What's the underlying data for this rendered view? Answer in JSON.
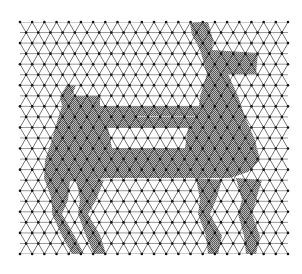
{
  "figure": {
    "width": 302,
    "height": 274,
    "background": "#ffffff",
    "lattice": {
      "x0": 20,
      "x1": 288,
      "y0": 22,
      "y1": 254,
      "rows": 22,
      "cols": 22,
      "line_color": "#3a3a3a",
      "horizontal_color": "#8a8a8a",
      "dot_color": "#111111",
      "dot_radius": 1.3
    },
    "fill": {
      "pattern_dark": "#555555",
      "pattern_light": "#bdbdbd"
    },
    "silhouette": {
      "parts": [
        {
          "name": "tail",
          "points": [
            [
              60,
              96
            ],
            [
              67,
              85
            ],
            [
              76,
              85
            ],
            [
              72,
              96
            ],
            [
              62,
              106
            ]
          ]
        },
        {
          "name": "body-main",
          "points": [
            [
              62,
              106
            ],
            [
              72,
              96
            ],
            [
              100,
              96
            ],
            [
              100,
              106
            ],
            [
              100,
              116
            ],
            [
              137,
              116
            ],
            [
              137,
              117
            ],
            [
              245,
              117
            ],
            [
              255,
              140
            ],
            [
              260,
              160
            ],
            [
              248,
              172
            ],
            [
              230,
              178
            ],
            [
              108,
              178
            ],
            [
              85,
              180
            ],
            [
              62,
              182
            ],
            [
              44,
              178
            ],
            [
              45,
              160
            ],
            [
              52,
              140
            ],
            [
              58,
              118
            ]
          ]
        },
        {
          "name": "neck-head",
          "points": [
            [
              190,
              23
            ],
            [
              199,
              22
            ],
            [
              204,
              35
            ],
            [
              212,
              50
            ],
            [
              258,
              53
            ],
            [
              256,
              74
            ],
            [
              228,
              74
            ],
            [
              238,
              96
            ],
            [
              245,
              117
            ],
            [
              198,
              117
            ],
            [
              200,
              96
            ],
            [
              207,
              74
            ],
            [
              200,
              50
            ],
            [
              192,
              35
            ]
          ]
        },
        {
          "name": "ear",
          "points": [
            [
              199,
              22
            ],
            [
              208,
              22
            ],
            [
              213,
              40
            ],
            [
              212,
              50
            ],
            [
              204,
              35
            ]
          ]
        },
        {
          "name": "back-band",
          "points": [
            [
              100,
              106
            ],
            [
              200,
              106
            ],
            [
              200,
              116
            ],
            [
              100,
              116
            ]
          ]
        },
        {
          "name": "belly-band",
          "points": [
            [
              108,
              148
            ],
            [
              245,
              148
            ],
            [
              252,
              160
            ],
            [
              248,
              172
            ],
            [
              108,
              172
            ]
          ]
        },
        {
          "name": "rear-leg-back",
          "points": [
            [
              44,
              178
            ],
            [
              70,
              180
            ],
            [
              68,
              200
            ],
            [
              62,
              214
            ],
            [
              74,
              235
            ],
            [
              84,
              254
            ],
            [
              72,
              254
            ],
            [
              62,
              236
            ],
            [
              52,
              214
            ],
            [
              52,
              200
            ]
          ]
        },
        {
          "name": "rear-leg-front",
          "points": [
            [
              76,
              178
            ],
            [
              104,
              180
            ],
            [
              96,
              200
            ],
            [
              88,
              214
            ],
            [
              100,
              235
            ],
            [
              106,
              254
            ],
            [
              94,
              254
            ],
            [
              86,
              236
            ],
            [
              78,
              214
            ],
            [
              80,
              200
            ]
          ]
        },
        {
          "name": "front-leg-back",
          "points": [
            [
              196,
              178
            ],
            [
              222,
              180
            ],
            [
              216,
              200
            ],
            [
              210,
              214
            ],
            [
              222,
              236
            ],
            [
              218,
              254
            ],
            [
              208,
              254
            ],
            [
              206,
              236
            ],
            [
              198,
              214
            ],
            [
              200,
              200
            ]
          ]
        },
        {
          "name": "front-leg-front",
          "points": [
            [
              236,
              178
            ],
            [
              262,
              180
            ],
            [
              256,
              200
            ],
            [
              252,
              214
            ],
            [
              260,
              236
            ],
            [
              256,
              254
            ],
            [
              246,
              254
            ],
            [
              244,
              236
            ],
            [
              238,
              214
            ],
            [
              242,
              200
            ]
          ]
        }
      ],
      "holes": [
        {
          "name": "gap-upper",
          "points": [
            [
              88,
              85
            ],
            [
              175,
              85
            ],
            [
              170,
              96
            ],
            [
              100,
              96
            ]
          ]
        },
        {
          "name": "gap-middle",
          "points": [
            [
              108,
              128
            ],
            [
              188,
              128
            ],
            [
              185,
              148
            ],
            [
              112,
              148
            ]
          ]
        }
      ]
    }
  }
}
